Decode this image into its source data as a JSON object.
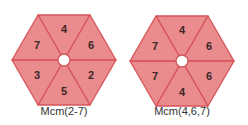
{
  "figures": [
    {
      "caption": "Mcm(2-7)",
      "segments": {
        "top": "4",
        "upper_right": "6",
        "lower_right": "2",
        "bottom": "5",
        "lower_left": "3",
        "upper_left": "7"
      }
    },
    {
      "caption": "Mcm(4,6,7)",
      "segments": {
        "top": "4",
        "upper_right": "6",
        "lower_right": "6",
        "bottom": "4",
        "lower_left": "7",
        "upper_left": "7"
      }
    }
  ],
  "colors": {
    "fill": "#ea8b8d",
    "stroke": "#d5545a",
    "label": "#3b2727"
  }
}
